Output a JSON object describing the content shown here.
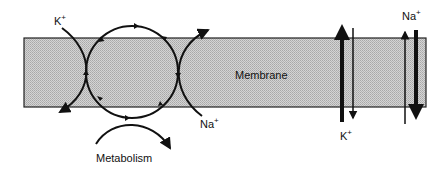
{
  "diagram": {
    "membrane": {
      "label": "Membrane",
      "fill": "#c8c8c8",
      "stroke": "#222222"
    },
    "pump": {
      "left_ion": {
        "symbol": "K",
        "charge": "+"
      },
      "right_ion": {
        "symbol": "Na",
        "charge": "+"
      },
      "energy_label": "Metabolism"
    },
    "passive_channels": {
      "k": {
        "symbol": "K",
        "charge": "+"
      },
      "na": {
        "symbol": "Na",
        "charge": "+"
      }
    },
    "colors": {
      "line": "#111111",
      "background": "#ffffff"
    }
  }
}
